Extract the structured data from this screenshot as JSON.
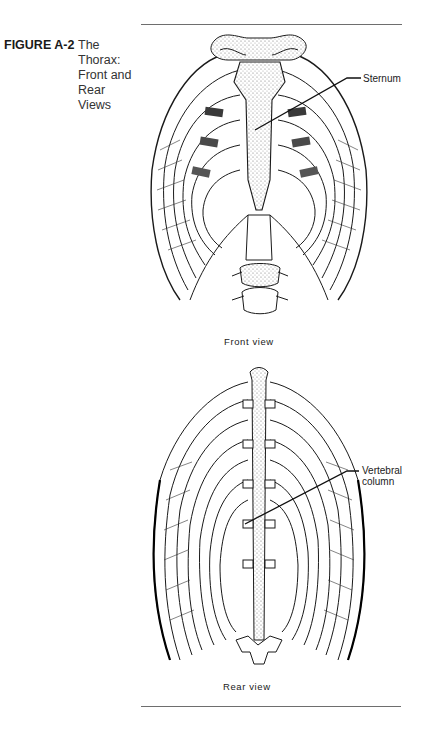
{
  "figure": {
    "number": "FIGURE A-2",
    "title_lines": [
      "The",
      "Thorax:",
      "Front and",
      "Rear",
      "Views"
    ]
  },
  "front_view": {
    "caption": "Front view",
    "callouts": [
      {
        "label": "Sternum"
      }
    ]
  },
  "rear_view": {
    "caption": "Rear view",
    "callouts": [
      {
        "label_lines": [
          "Vertebral",
          "column"
        ]
      }
    ]
  },
  "colors": {
    "ink": "#1a1a1a",
    "rule": "#6e6e6e",
    "stipple": "#9a9a9a",
    "paper": "#ffffff"
  }
}
